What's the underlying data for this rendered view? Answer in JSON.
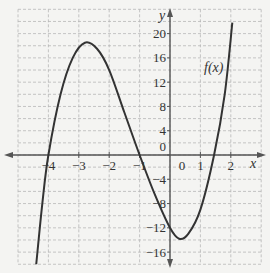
{
  "chart_data": {
    "type": "line",
    "title": "",
    "xlabel": "x",
    "ylabel": "y",
    "curve_label": "f(x)",
    "xlim": [
      -5,
      3
    ],
    "ylim": [
      -18,
      24
    ],
    "grid": true,
    "x_ticks": [
      -4,
      -3,
      -2,
      -1,
      0,
      1,
      2
    ],
    "x_tick_labels": [
      "−4",
      "−3",
      "−2",
      "−1",
      "0",
      "1",
      "2"
    ],
    "y_ticks": [
      20,
      16,
      12,
      8,
      4,
      0,
      -4,
      -8,
      -12,
      -16
    ],
    "y_tick_labels": [
      "20",
      "16",
      "12",
      "8",
      "4",
      "0",
      "−4",
      "−8",
      "−12",
      "−16"
    ],
    "series": [
      {
        "name": "f(x)",
        "x": [
          -4.4,
          -4.2,
          -4.0,
          -3.6,
          -3.2,
          -2.8,
          -2.4,
          -2.0,
          -1.5,
          -1.0,
          -0.5,
          0.0,
          0.3,
          0.6,
          1.0,
          1.45,
          1.8,
          2.05
        ],
        "y": [
          -18,
          -8,
          0,
          10,
          16,
          18.5,
          17.5,
          14,
          7,
          0,
          -6.5,
          -12,
          -13.8,
          -13,
          -9,
          0,
          10,
          21.8
        ]
      }
    ],
    "features": {
      "x_intercepts": [
        -4,
        -1,
        1.45
      ],
      "local_max": [
        -2.8,
        18.5
      ],
      "local_min": [
        0.3,
        -13.8
      ],
      "y_intercept": -12
    }
  },
  "colors": {
    "background": "#f4f4f2",
    "grid": "#b8b8b8",
    "axis": "#555555",
    "curve": "#333333"
  }
}
